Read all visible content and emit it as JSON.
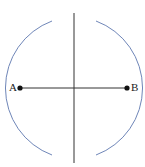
{
  "diagram": {
    "points": [
      {
        "label": "A",
        "x": 20,
        "y": 88
      },
      {
        "label": "B",
        "x": 127,
        "y": 88
      }
    ],
    "segment": {
      "from": "A",
      "to": "B"
    },
    "bisector": {
      "x": 74,
      "y1": 13,
      "y2": 163
    },
    "arcs": [
      {
        "center": "A",
        "radius": 71.5
      },
      {
        "center": "B",
        "radius": 71.5
      }
    ],
    "intersections": [
      {
        "x": 74,
        "y": 40
      },
      {
        "x": 74,
        "y": 137
      }
    ],
    "colors": {
      "line": "#333333",
      "arc": "#6f86b8",
      "point": "#111111"
    }
  },
  "labels": {
    "a": "A",
    "b": "B"
  }
}
